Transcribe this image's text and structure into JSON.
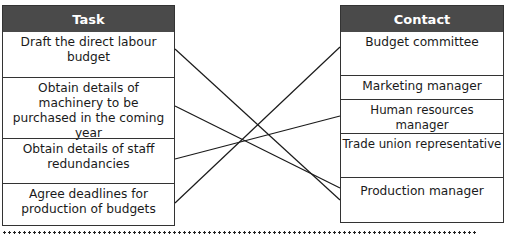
{
  "left_table": {
    "header": "Task",
    "rows": [
      "Draft the direct labour budget",
      "Obtain details of machinery to be purchased in the coming year",
      "Obtain details of staff redundancies",
      "Agree deadlines for production of budgets"
    ]
  },
  "right_table": {
    "header": "Contact",
    "rows": [
      "Budget committee",
      "Marketing manager",
      "Human resources manager",
      "Trade union representative",
      "Production manager"
    ]
  },
  "connections": [
    {
      "task": "Draft the direct labour budget",
      "contact": "Production manager"
    },
    {
      "task": "Obtain details of machinery to be purchased in the coming year",
      "contact": "Production manager"
    },
    {
      "task": "Obtain details of staff redundancies",
      "contact": "Human resources manager"
    },
    {
      "task": "Agree deadlines for production of budgets",
      "contact": "Budget committee"
    }
  ],
  "colors": {
    "header_bg": "#4a4a4a",
    "line": "#1a1a1a"
  }
}
